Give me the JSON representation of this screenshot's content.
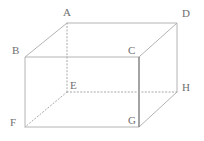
{
  "figure": {
    "name": "rectangular-prism-cuboid",
    "canvas": {
      "width": 204,
      "height": 141,
      "background": "#ffffff"
    },
    "colors": {
      "visible_edge": "#b4b4b4",
      "emphasized_edge": "#7d7d7d",
      "hidden_edge": "#a8a8a8",
      "label_text": "#6e6e6e"
    },
    "vertices": [
      {
        "id": "A",
        "label": "A",
        "x": 67,
        "y": 23,
        "label_x": 63,
        "label_y": 7,
        "hidden": false
      },
      {
        "id": "B",
        "label": "B",
        "x": 25,
        "y": 57,
        "label_x": 12,
        "label_y": 45,
        "hidden": false
      },
      {
        "id": "C",
        "label": "C",
        "x": 139,
        "y": 57,
        "label_x": 128,
        "label_y": 45,
        "hidden": false
      },
      {
        "id": "D",
        "label": "D",
        "x": 177,
        "y": 23,
        "label_x": 182,
        "label_y": 8,
        "hidden": false
      },
      {
        "id": "E",
        "label": "E",
        "x": 67,
        "y": 92,
        "label_x": 70,
        "label_y": 80,
        "hidden": true
      },
      {
        "id": "F",
        "label": "F",
        "x": 25,
        "y": 127,
        "label_x": 10,
        "label_y": 117,
        "hidden": false
      },
      {
        "id": "G",
        "label": "G",
        "x": 139,
        "y": 127,
        "label_x": 128,
        "label_y": 115,
        "hidden": false
      },
      {
        "id": "H",
        "label": "H",
        "x": 177,
        "y": 92,
        "label_x": 182,
        "label_y": 82,
        "hidden": false
      }
    ],
    "edges": [
      {
        "id": "AD",
        "from": "A",
        "to": "D",
        "style": "solid",
        "stroke": "#b4b4b4",
        "width": 1
      },
      {
        "id": "AB",
        "from": "A",
        "to": "B",
        "style": "solid",
        "stroke": "#b4b4b4",
        "width": 1
      },
      {
        "id": "DC",
        "from": "D",
        "to": "C",
        "style": "solid",
        "stroke": "#b4b4b4",
        "width": 1
      },
      {
        "id": "BC",
        "from": "B",
        "to": "C",
        "style": "solid",
        "stroke": "#b4b4b4",
        "width": 1
      },
      {
        "id": "BF",
        "from": "B",
        "to": "F",
        "style": "solid",
        "stroke": "#b4b4b4",
        "width": 1
      },
      {
        "id": "DH",
        "from": "D",
        "to": "H",
        "style": "solid",
        "stroke": "#b4b4b4",
        "width": 1
      },
      {
        "id": "FG",
        "from": "F",
        "to": "G",
        "style": "solid",
        "stroke": "#b4b4b4",
        "width": 1
      },
      {
        "id": "GH",
        "from": "G",
        "to": "H",
        "style": "solid",
        "stroke": "#b4b4b4",
        "width": 1
      },
      {
        "id": "CG",
        "from": "C",
        "to": "G",
        "style": "solid",
        "stroke": "#7d7d7d",
        "width": 1.4
      },
      {
        "id": "AE",
        "from": "A",
        "to": "E",
        "style": "dotted",
        "stroke": "#a8a8a8",
        "width": 1
      },
      {
        "id": "EF",
        "from": "E",
        "to": "F",
        "style": "dotted",
        "stroke": "#a8a8a8",
        "width": 1
      },
      {
        "id": "EH",
        "from": "E",
        "to": "H",
        "style": "dotted",
        "stroke": "#a8a8a8",
        "width": 1
      }
    ]
  }
}
